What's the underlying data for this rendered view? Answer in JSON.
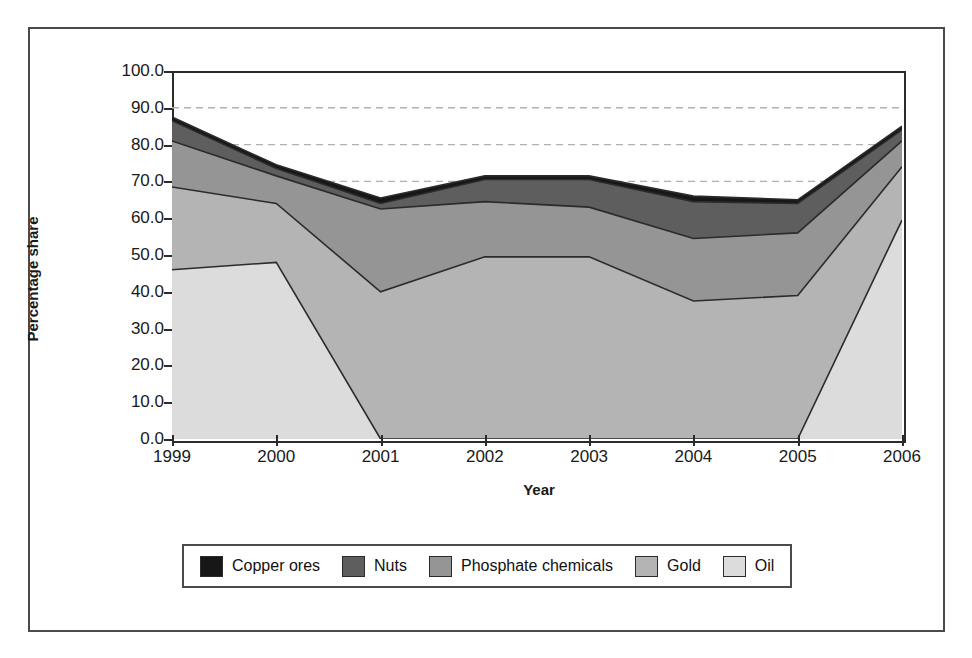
{
  "chart_data": {
    "type": "area",
    "stacked": true,
    "title": "",
    "xlabel": "Year",
    "ylabel": "Percentage share",
    "categories": [
      "1999",
      "2000",
      "2001",
      "2002",
      "2003",
      "2004",
      "2005",
      "2006"
    ],
    "x": [
      1999,
      2000,
      2001,
      2002,
      2003,
      2004,
      2005,
      2006
    ],
    "ylim": [
      0.0,
      100.0
    ],
    "yticks": [
      "0.0",
      "10.0",
      "20.0",
      "30.0",
      "40.0",
      "50.0",
      "60.0",
      "70.0",
      "80.0",
      "90.0",
      "100.0"
    ],
    "ytick_values": [
      0,
      10,
      20,
      30,
      40,
      50,
      60,
      70,
      80,
      90,
      100
    ],
    "grid": "horizontal-dashed-partial",
    "gridlines_at": [
      70,
      80,
      90
    ],
    "legend_position": "bottom",
    "stack_order_bottom_to_top": [
      "Oil",
      "Gold",
      "Phosphate chemicals",
      "Nuts",
      "Copper ores"
    ],
    "series": [
      {
        "name": "Oil",
        "color": "#dcdcdc",
        "values": [
          46.0,
          48.0,
          0.0,
          0.0,
          0.0,
          0.0,
          0.0,
          59.5
        ],
        "cumulative_top": [
          46.0,
          48.0,
          0.0,
          0.0,
          0.0,
          0.0,
          0.0,
          59.5
        ]
      },
      {
        "name": "Gold",
        "color": "#b4b4b4",
        "values": [
          22.5,
          16.0,
          40.0,
          49.5,
          49.5,
          37.5,
          39.0,
          14.5
        ],
        "cumulative_top": [
          68.5,
          64.0,
          40.0,
          49.5,
          49.5,
          37.5,
          39.0,
          74.0
        ]
      },
      {
        "name": "Phosphate chemicals",
        "color": "#959595",
        "values": [
          12.5,
          7.5,
          22.5,
          15.0,
          13.5,
          17.0,
          17.0,
          7.0
        ],
        "cumulative_top": [
          81.0,
          71.5,
          62.5,
          64.5,
          63.0,
          54.5,
          56.0,
          81.0
        ]
      },
      {
        "name": "Nuts",
        "color": "#5e5e5e",
        "values": [
          5.5,
          2.0,
          1.5,
          6.0,
          7.5,
          10.0,
          8.0,
          3.0
        ],
        "cumulative_top": [
          86.5,
          73.5,
          64.0,
          70.5,
          70.5,
          64.5,
          64.0,
          84.0
        ]
      },
      {
        "name": "Copper ores",
        "color": "#171717",
        "values": [
          1.0,
          1.0,
          1.5,
          1.0,
          1.0,
          1.5,
          1.0,
          1.0
        ],
        "cumulative_top": [
          87.5,
          74.5,
          65.5,
          71.5,
          71.5,
          66.0,
          65.0,
          85.0
        ]
      }
    ]
  },
  "axes": {
    "y_title": "Percentage share",
    "x_title": "Year"
  },
  "legend": {
    "items": [
      {
        "label": "Copper ores",
        "color": "#171717"
      },
      {
        "label": "Nuts",
        "color": "#5e5e5e"
      },
      {
        "label": "Phosphate chemicals",
        "color": "#959595"
      },
      {
        "label": "Gold",
        "color": "#b4b4b4"
      },
      {
        "label": "Oil",
        "color": "#dcdcdc"
      }
    ]
  },
  "style": {
    "frame_color": "#4a4a4a",
    "axis_color": "#2b2b2b",
    "grid_color": "#b0b0b0",
    "background": "#ffffff",
    "text_color": "#1a1a1a"
  }
}
